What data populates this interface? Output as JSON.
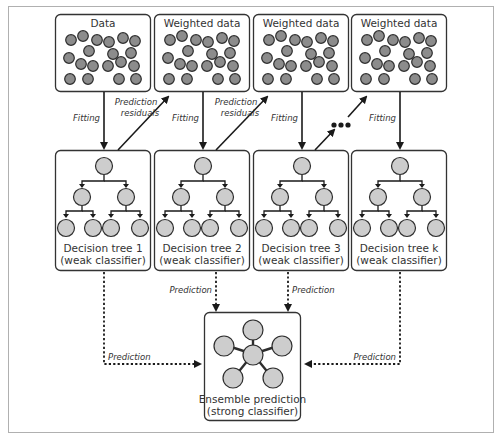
{
  "colors": {
    "frame": "#b0b0b0",
    "box_stroke": "#333333",
    "data_point_fill": "#8c8c8c",
    "data_point_stroke": "#2e2e2e",
    "node_fill": "#cdcdcd",
    "node_stroke": "#2e2e2e",
    "arrow": "#1a1a1a",
    "text": "#333333"
  },
  "data_boxes": [
    {
      "title": "Data"
    },
    {
      "title": "Weighted data"
    },
    {
      "title": "Weighted data"
    },
    {
      "title": "Weighted data"
    }
  ],
  "tree_boxes": [
    {
      "line1": "Decision tree 1",
      "line2": "(weak classifier)"
    },
    {
      "line1": "Decision tree 2",
      "line2": "(weak classifier)"
    },
    {
      "line1": "Decision tree 3",
      "line2": "(weak classifier)"
    },
    {
      "line1": "Decision tree k",
      "line2": "(weak classifier)"
    }
  ],
  "ensemble": {
    "line1": "Ensemble prediction",
    "line2": "(strong classifier)"
  },
  "labels": {
    "fitting": "Fitting",
    "residuals_line1": "Prediction",
    "residuals_line2": "residuals",
    "prediction": "Prediction",
    "ellipsis": "..."
  }
}
